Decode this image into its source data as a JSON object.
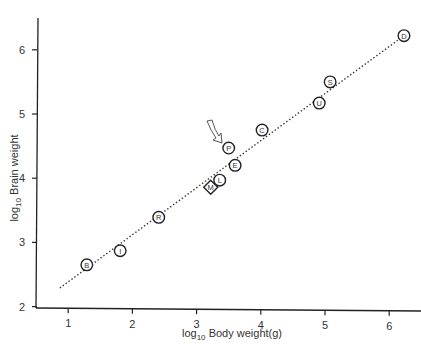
{
  "chart_data": {
    "type": "scatter",
    "title": "",
    "xlabel": "log10 Body weight(g)",
    "xlabel_parts": {
      "prefix": "log",
      "sub": "10",
      "rest": " Body weight(g)"
    },
    "ylabel": "log10 Brain weight",
    "ylabel_parts": {
      "prefix": "log",
      "sub": "10",
      "rest": " Brain weight"
    },
    "xticks": [
      "1",
      "2",
      "3",
      "4",
      "5",
      "6"
    ],
    "yticks": [
      "2",
      "3",
      "4",
      "5",
      "6"
    ],
    "xlim": [
      0.5,
      6.5
    ],
    "ylim": [
      2,
      6.6
    ],
    "grid": false,
    "legend": null,
    "points": [
      {
        "label": "B",
        "x": 1.29,
        "y": 2.65,
        "marker": "circle"
      },
      {
        "label": "I",
        "x": 1.81,
        "y": 2.87,
        "marker": "circle"
      },
      {
        "label": "R",
        "x": 2.41,
        "y": 3.39,
        "marker": "circle"
      },
      {
        "label": "M",
        "x": 3.22,
        "y": 3.86,
        "marker": "diamond"
      },
      {
        "label": "L",
        "x": 3.36,
        "y": 3.97,
        "marker": "circle"
      },
      {
        "label": "E",
        "x": 3.6,
        "y": 4.2,
        "marker": "circle"
      },
      {
        "label": "P",
        "x": 3.5,
        "y": 4.47,
        "marker": "circle"
      },
      {
        "label": "C",
        "x": 4.02,
        "y": 4.75,
        "marker": "circle"
      },
      {
        "label": "U",
        "x": 4.91,
        "y": 5.17,
        "marker": "circle"
      },
      {
        "label": "S",
        "x": 5.08,
        "y": 5.5,
        "marker": "circle"
      },
      {
        "label": "D",
        "x": 6.23,
        "y": 6.22,
        "marker": "circle"
      }
    ],
    "trend_line": {
      "style": "dotted",
      "x": [
        0.87,
        6.23
      ],
      "y": [
        2.29,
        6.22
      ]
    },
    "annotations": [
      {
        "type": "arrow",
        "points_to": "P",
        "description": "curved hollow arrow pointing at P"
      }
    ]
  }
}
